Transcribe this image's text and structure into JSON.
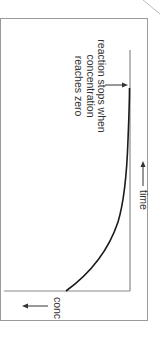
{
  "diagram": {
    "type": "concentration-vs-time graph (rotated 90° clockwise)",
    "annotation": {
      "lines": [
        "reaction stops when",
        "concentration",
        "reaches zero"
      ]
    },
    "x_axis_label": "time",
    "y_axis_label": "conc",
    "curve_description": "concentration decreases and reaches zero"
  },
  "colors": {
    "frame": "#9a9a9a",
    "axis": "#8a8a8a",
    "curve": "#1a1a1a",
    "text": "#333333"
  }
}
